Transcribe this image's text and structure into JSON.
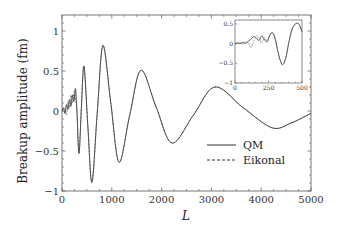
{
  "chart_data": {
    "type": "line",
    "title": "",
    "xlabel": "L",
    "ylabel": "Breakup amplitude (fm)",
    "xlim": [
      0,
      5000
    ],
    "ylim": [
      -1,
      1.2
    ],
    "xticks": [
      0,
      1000,
      2000,
      3000,
      4000,
      5000
    ],
    "xtick_labels": [
      "0",
      "1000",
      "2000",
      "3000",
      "4000",
      "5000"
    ],
    "yticks": [
      -1,
      -0.5,
      0,
      0.5,
      1
    ],
    "ytick_labels": [
      "−1",
      "−0.5",
      "0",
      "0.5",
      "1"
    ],
    "grid": false,
    "legend": "center-right",
    "series": [
      {
        "name": "QM",
        "style": "solid",
        "x": [
          0,
          30,
          60,
          90,
          120,
          150,
          180,
          210,
          240,
          270,
          300,
          341,
          390,
          442,
          520,
          602,
          710,
          823,
          980,
          1145,
          1360,
          1586,
          1890,
          2209,
          2640,
          3072,
          3640,
          4217,
          4600,
          5000
        ],
        "y": [
          0.0,
          0.04,
          -0.03,
          0.08,
          0.02,
          0.14,
          0.06,
          0.2,
          0.12,
          0.28,
          0.0,
          -0.53,
          0.05,
          0.56,
          -0.2,
          -0.89,
          0.0,
          0.82,
          0.1,
          -0.64,
          -0.05,
          0.51,
          0.05,
          -0.4,
          -0.05,
          0.3,
          0.04,
          -0.21,
          -0.15,
          -0.03
        ]
      },
      {
        "name": "Eikonal",
        "style": "dashed",
        "x": [
          0,
          30,
          60,
          90,
          120,
          150,
          180,
          210,
          240,
          270,
          300,
          341,
          390,
          442,
          520,
          602,
          710,
          823,
          980,
          1145,
          1360,
          1586,
          1890,
          2209,
          2640,
          3072,
          3640,
          4217,
          4600,
          5000
        ],
        "y": [
          0.0,
          0.02,
          0.03,
          -0.05,
          0.12,
          0.04,
          0.2,
          0.1,
          0.24,
          0.15,
          0.0,
          -0.53,
          0.05,
          0.56,
          -0.2,
          -0.89,
          0.0,
          0.82,
          0.1,
          -0.64,
          -0.05,
          0.51,
          0.05,
          -0.4,
          -0.05,
          0.3,
          0.04,
          -0.21,
          -0.15,
          -0.03
        ]
      }
    ],
    "inset": {
      "xlim": [
        0,
        500
      ],
      "ylim": [
        -1,
        0.6
      ],
      "xticks": [
        0,
        250,
        500
      ],
      "xtick_labels": [
        "0",
        "250",
        "500"
      ],
      "yticks": [
        -1,
        -0.5,
        0,
        0.5
      ],
      "ytick_labels": [
        "−1",
        "−0.5",
        "0",
        "0.5"
      ],
      "series": [
        {
          "name": "QM",
          "style": "solid",
          "x": [
            0,
            20,
            40,
            60,
            80,
            100,
            120,
            140,
            160,
            180,
            200,
            220,
            240,
            260,
            280,
            300,
            320,
            340,
            358,
            380,
            400,
            420,
            440,
            463,
            480,
            500
          ],
          "y": [
            0.0,
            0.02,
            0.0,
            0.03,
            0.01,
            0.06,
            0.12,
            0.18,
            0.14,
            0.08,
            0.2,
            0.1,
            0.05,
            0.22,
            0.28,
            0.12,
            -0.2,
            -0.45,
            -0.53,
            -0.35,
            0.0,
            0.3,
            0.46,
            0.52,
            0.48,
            0.3
          ]
        },
        {
          "name": "Eikonal",
          "style": "dashed",
          "x": [
            0,
            20,
            40,
            60,
            80,
            100,
            120,
            140,
            160,
            180,
            200,
            220,
            240,
            260,
            280,
            300,
            320,
            340,
            358,
            380,
            400,
            420,
            440,
            463,
            480,
            500
          ],
          "y": [
            0.0,
            0.0,
            0.02,
            -0.01,
            0.04,
            0.02,
            -0.1,
            0.05,
            0.2,
            0.12,
            0.02,
            0.15,
            0.06,
            0.2,
            0.27,
            0.12,
            -0.2,
            -0.45,
            -0.53,
            -0.35,
            0.0,
            0.3,
            0.46,
            0.52,
            0.48,
            0.3
          ]
        }
      ]
    }
  }
}
